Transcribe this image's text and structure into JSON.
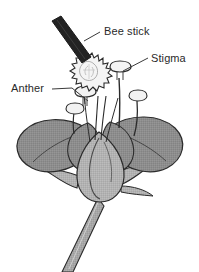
{
  "figure": {
    "background_color": "#ffffff",
    "width": 199,
    "height": 272
  },
  "labels": [
    {
      "id": "bee-stick",
      "text": "Bee stick",
      "x": 104,
      "y": 35,
      "anchor": "start"
    },
    {
      "id": "stigma",
      "text": "Stigma",
      "x": 151,
      "y": 62,
      "anchor": "start"
    },
    {
      "id": "anther",
      "text": "Anther",
      "x": 11,
      "y": 92,
      "anchor": "start"
    }
  ],
  "colors": {
    "outline": "#2b2b2b",
    "petal_fill": "#8d8d8d",
    "ovary_fill": "#b2b2b2",
    "sepal_fill": "#a8a8a8",
    "stem_fill": "#a6a6a6",
    "stalk_fill": "#f2f2f2",
    "bee_stick_fill": "#232323",
    "pollen_fill": "#f4f4f4",
    "label_text": "#2a2a2a",
    "leader_line": "#3a3a3a",
    "background": "#ffffff"
  },
  "parts": [
    {
      "id": "bee-stick",
      "name": "bee-stick",
      "description": "dark angled applicator rod"
    },
    {
      "id": "pollen-mass",
      "name": "pollen-mass",
      "description": "spiky pollen ball on tip of bee stick"
    },
    {
      "id": "anther",
      "name": "anther",
      "description": "pollen-bearing stalk head"
    },
    {
      "id": "stigma",
      "name": "stigma",
      "description": "mushroom-shaped receptive stalk head"
    },
    {
      "id": "petals",
      "name": "petals",
      "description": "four spreading gray petals"
    },
    {
      "id": "ovary",
      "name": "ovary",
      "description": "teardrop shaped swollen base"
    },
    {
      "id": "sepals",
      "name": "sepals",
      "description": "pointed leaf-like structures at base"
    },
    {
      "id": "stem",
      "name": "stem",
      "description": "thick stalk descending to bottom edge"
    }
  ]
}
